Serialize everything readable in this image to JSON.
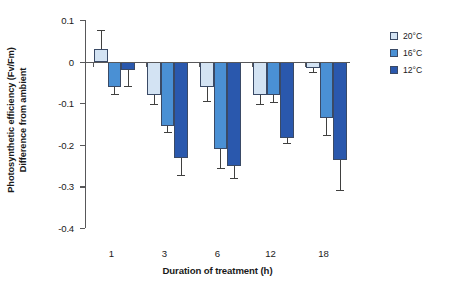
{
  "chart_data": {
    "type": "bar",
    "title": "",
    "xlabel": "Duration of treatment (h)",
    "ylabel": "Photosynthetic efficiency (Fv/Fm) Difference from ambient",
    "ylabel_line1": "Photosynthetic efficiency (Fv/Fm)",
    "ylabel_line2": "Difference from ambient",
    "categories": [
      "1",
      "3",
      "6",
      "12",
      "18"
    ],
    "ylim": [
      -0.4,
      0.1
    ],
    "yticks": [
      "0.1",
      "0",
      "-0.1",
      "-0.2",
      "-0.3",
      "-0.4"
    ],
    "ytick_values": [
      0.1,
      0,
      -0.1,
      -0.2,
      -0.3,
      -0.4
    ],
    "grid": false,
    "legend_position": "right",
    "error_bars": "standard error",
    "series": [
      {
        "name": "20°C",
        "color": "#d3e3f3",
        "values": [
          0.03,
          -0.08,
          -0.06,
          -0.08,
          -0.015
        ],
        "errors": [
          0.045,
          0.022,
          0.035,
          0.021,
          0.011
        ]
      },
      {
        "name": "16°C",
        "color": "#4a90d4",
        "values": [
          -0.06,
          -0.155,
          -0.21,
          -0.08,
          -0.135
        ],
        "errors": [
          0.018,
          0.015,
          0.045,
          0.018,
          0.042
        ]
      },
      {
        "name": "12°C",
        "color": "#2a58ad",
        "values": [
          -0.021,
          -0.232,
          -0.252,
          -0.183,
          -0.237
        ],
        "errors": [
          0.038,
          0.04,
          0.027,
          0.013,
          0.072
        ]
      }
    ]
  },
  "axis": {
    "y_title_line1": "Photosynthetic efficiency (Fv/Fm)",
    "y_title_line2": "Difference from ambient",
    "x_title": "Duration of treatment (h)"
  },
  "legend": {
    "items": [
      {
        "label": "20°C",
        "color": "#d3e3f3"
      },
      {
        "label": "16°C",
        "color": "#4a90d4"
      },
      {
        "label": "12°C",
        "color": "#2a58ad"
      }
    ]
  },
  "colors": {
    "axis": "#58585a",
    "bar_outline": "#3a4a66",
    "error_bar": "#40403f",
    "text": "#1a1a1a",
    "background": "#ffffff"
  }
}
